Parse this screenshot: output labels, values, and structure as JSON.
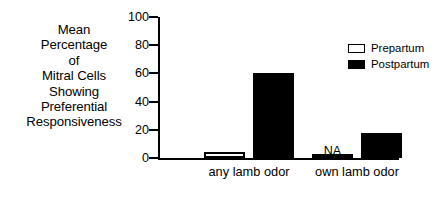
{
  "chart_data": {
    "type": "bar",
    "title": "",
    "subtitle": "",
    "xlabel": "",
    "ylabel": "Mean Percentage of Mitral Cells Showing Preferential Responsiveness",
    "ylabel_lines": [
      "Mean",
      "Percentage",
      "of",
      "Mitral Cells",
      "Showing",
      "Preferential",
      "Responsiveness"
    ],
    "categories": [
      "any lamb odor",
      "own lamb odor"
    ],
    "series": [
      {
        "name": "Prepartum",
        "values": [
          4,
          0
        ],
        "color": "#ffffff",
        "edge_color": "#000000"
      },
      {
        "name": "Postpartum",
        "values": [
          60,
          18
        ],
        "color": "#000000",
        "edge_color": "#000000"
      }
    ],
    "ylim": [
      0,
      100
    ],
    "yticks": [
      0,
      20,
      40,
      60,
      80,
      100
    ],
    "ytick_labels": [
      "0",
      "20",
      "40",
      "60",
      "80",
      "100"
    ],
    "grid": false,
    "legend_position": "upper right",
    "annotations": [
      {
        "text": "NA",
        "series": "Prepartum",
        "category": "own lamb odor"
      }
    ]
  },
  "legend": {
    "entries": [
      {
        "label": "Prepartum",
        "swatch": "open-square-icon"
      },
      {
        "label": "Postpartum",
        "swatch": "filled-square-icon"
      }
    ]
  }
}
